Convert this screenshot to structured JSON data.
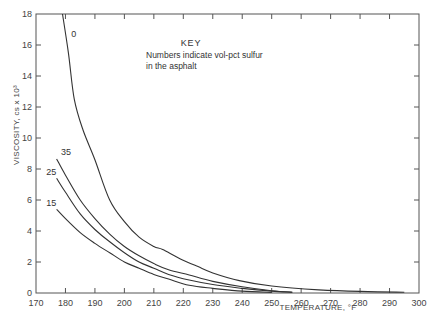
{
  "chart_data": {
    "type": "line",
    "title": "",
    "xlabel": "TEMPERATURE, °F",
    "ylabel": "VISCOSITY, cs x 10³",
    "xlim": [
      170,
      300
    ],
    "ylim": [
      0,
      18
    ],
    "xticks": [
      170,
      180,
      190,
      200,
      210,
      220,
      230,
      240,
      250,
      260,
      270,
      280,
      290,
      300
    ],
    "yticks": [
      0,
      2,
      4,
      6,
      8,
      10,
      12,
      14,
      16,
      18
    ],
    "grid": false,
    "key": {
      "title": "KEY",
      "line1": "Numbers indicate vol-pct sulfur",
      "line2": "in the asphalt"
    },
    "series": [
      {
        "name": "0",
        "x": [
          179,
          181,
          183,
          186,
          190,
          195,
          200,
          205,
          210,
          213,
          219,
          225,
          230,
          239,
          250,
          266,
          280,
          295
        ],
        "y": [
          18,
          15.5,
          12.5,
          10.5,
          8.6,
          6.0,
          4.6,
          3.6,
          3.0,
          2.8,
          2.2,
          1.7,
          1.3,
          0.8,
          0.45,
          0.2,
          0.1,
          0.05
        ]
      },
      {
        "name": "35",
        "x": [
          177,
          180,
          185,
          190,
          195,
          200,
          205,
          210,
          215,
          222,
          230,
          240,
          250,
          257
        ],
        "y": [
          8.65,
          7.6,
          6.0,
          4.8,
          3.8,
          3.0,
          2.4,
          1.9,
          1.5,
          1.16,
          0.75,
          0.4,
          0.15,
          0.05
        ]
      },
      {
        "name": "25",
        "x": [
          177,
          180,
          185,
          190,
          195,
          200,
          205,
          210,
          215,
          222,
          230,
          240,
          250,
          257
        ],
        "y": [
          7.4,
          6.5,
          5.1,
          4.1,
          3.3,
          2.6,
          2.0,
          1.6,
          1.2,
          0.84,
          0.55,
          0.3,
          0.12,
          0.05
        ]
      },
      {
        "name": "15",
        "x": [
          177,
          180,
          185,
          190,
          195,
          200,
          205,
          210,
          215,
          222,
          230,
          240,
          250
        ],
        "y": [
          5.4,
          4.8,
          3.9,
          3.2,
          2.6,
          2.0,
          1.6,
          1.2,
          0.9,
          0.5,
          0.3,
          0.12,
          0.04
        ]
      }
    ],
    "series_labels": [
      {
        "name": "0",
        "text": "0",
        "x": 182,
        "y": 16.5
      },
      {
        "name": "35",
        "text": "35",
        "x": 178.5,
        "y": 8.9
      },
      {
        "name": "25",
        "text": "25",
        "x": 173.5,
        "y": 7.6
      },
      {
        "name": "15",
        "text": "15",
        "x": 173.5,
        "y": 5.6
      }
    ]
  }
}
